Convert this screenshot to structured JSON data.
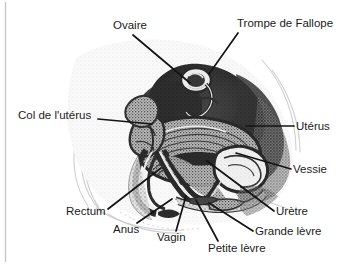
{
  "figure": {
    "type": "anatomical-diagram",
    "background_color": "#ffffff",
    "ink_color": "#1b1b1b",
    "border": {
      "side": "left",
      "color": "#c8c8c8"
    },
    "labels": [
      {
        "id": "ovaire",
        "text": "Ovaire",
        "x": 113,
        "y": 20,
        "anchor": "start",
        "leader": {
          "x1": 133,
          "y1": 35,
          "x2": 190,
          "y2": 83
        }
      },
      {
        "id": "trompe-de-fallope",
        "text": "Trompe de Fallope",
        "x": 237,
        "y": 18,
        "anchor": "start",
        "leader": {
          "x1": 238,
          "y1": 33,
          "x2": 209,
          "y2": 74
        }
      },
      {
        "id": "col-de-luterus",
        "text": "Col de l'utérus",
        "x": 18,
        "y": 110,
        "anchor": "start",
        "leader": {
          "x1": 98,
          "y1": 119,
          "x2": 152,
          "y2": 124
        }
      },
      {
        "id": "uterus",
        "text": "Utérus",
        "x": 296,
        "y": 121,
        "anchor": "start",
        "leader": {
          "x1": 294,
          "y1": 126,
          "x2": 246,
          "y2": 126
        }
      },
      {
        "id": "vessie",
        "text": "Vessie",
        "x": 293,
        "y": 164,
        "anchor": "start",
        "leader": {
          "x1": 291,
          "y1": 169,
          "x2": 236,
          "y2": 153
        }
      },
      {
        "id": "urethre",
        "text": "Urètre",
        "x": 276,
        "y": 206,
        "anchor": "start",
        "leader": {
          "x1": 274,
          "y1": 211,
          "x2": 207,
          "y2": 161
        }
      },
      {
        "id": "grande-levre",
        "text": "Grande lèvre",
        "x": 255,
        "y": 226,
        "anchor": "start",
        "leader": {
          "x1": 253,
          "y1": 231,
          "x2": 209,
          "y2": 203
        }
      },
      {
        "id": "petite-levre",
        "text": "Petite lèvre",
        "x": 208,
        "y": 243,
        "anchor": "start",
        "leader": {
          "x1": 218,
          "y1": 241,
          "x2": 196,
          "y2": 200
        }
      },
      {
        "id": "vagin",
        "text": "Vagin",
        "x": 157,
        "y": 232,
        "anchor": "start",
        "leader": {
          "x1": 176,
          "y1": 231,
          "x2": 186,
          "y2": 196
        }
      },
      {
        "id": "anus",
        "text": "Anus",
        "x": 113,
        "y": 224,
        "anchor": "start",
        "leader": {
          "x1": 137,
          "y1": 223,
          "x2": 172,
          "y2": 199
        }
      },
      {
        "id": "rectum",
        "text": "Rectum",
        "x": 66,
        "y": 206,
        "anchor": "start",
        "leader": {
          "x1": 108,
          "y1": 209,
          "x2": 161,
          "y2": 168
        }
      }
    ]
  }
}
